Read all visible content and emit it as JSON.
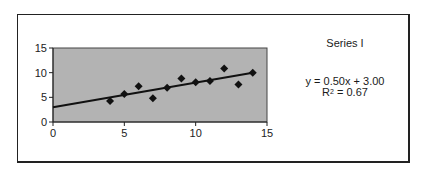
{
  "chart_data": {
    "type": "scatter",
    "title": "Series I",
    "xlabel": "",
    "ylabel": "",
    "xlim": [
      0,
      15
    ],
    "ylim": [
      0,
      15
    ],
    "xticks": [
      0,
      5,
      10,
      15
    ],
    "yticks": [
      0,
      5,
      10,
      15
    ],
    "grid": false,
    "plot_background": "#b3b3b3",
    "marker": "diamond",
    "series": [
      {
        "name": "Series I",
        "x": [
          4,
          5,
          6,
          7,
          8,
          9,
          10,
          11,
          12,
          13,
          14
        ],
        "y": [
          4.26,
          5.68,
          7.24,
          4.82,
          6.95,
          8.81,
          8.04,
          8.33,
          10.84,
          7.58,
          9.96
        ]
      }
    ],
    "trendline": {
      "slope": 0.5,
      "intercept": 3.0,
      "r_squared": 0.67,
      "x_range": [
        0,
        14
      ]
    },
    "annotations": {
      "equation": "y = 0.50x + 3.00",
      "r2_label": "R",
      "r2_sup": "2",
      "r2_value": " = 0.67"
    }
  },
  "legend": {
    "series_label": "Series I"
  }
}
